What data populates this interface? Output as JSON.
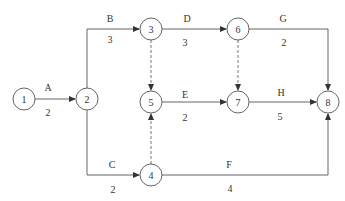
{
  "diagram": {
    "type": "activity-on-arrow network",
    "nodes": [
      {
        "id": "1",
        "label": "1",
        "x": 24,
        "y": 99
      },
      {
        "id": "2",
        "label": "2",
        "x": 87,
        "y": 99
      },
      {
        "id": "3",
        "label": "3",
        "x": 151,
        "y": 29
      },
      {
        "id": "4",
        "label": "4",
        "x": 151,
        "y": 175
      },
      {
        "id": "5",
        "label": "5",
        "x": 151,
        "y": 102
      },
      {
        "id": "6",
        "label": "6",
        "x": 238,
        "y": 29
      },
      {
        "id": "7",
        "label": "7",
        "x": 238,
        "y": 102
      },
      {
        "id": "8",
        "label": "8",
        "x": 328,
        "y": 102
      }
    ],
    "activities": [
      {
        "name": "A",
        "from": "1",
        "to": "2",
        "duration": "2"
      },
      {
        "name": "B",
        "from": "2",
        "to": "3",
        "duration": "3"
      },
      {
        "name": "C",
        "from": "2",
        "to": "4",
        "duration": "2"
      },
      {
        "name": "D",
        "from": "3",
        "to": "6",
        "duration": "3"
      },
      {
        "name": "E",
        "from": "5",
        "to": "7",
        "duration": "2"
      },
      {
        "name": "F",
        "from": "4",
        "to": "8",
        "duration": "4"
      },
      {
        "name": "G",
        "from": "6",
        "to": "8",
        "duration": "2"
      },
      {
        "name": "H",
        "from": "7",
        "to": "8",
        "duration": "5"
      }
    ],
    "dummies": [
      {
        "from": "3",
        "to": "5"
      },
      {
        "from": "4",
        "to": "5"
      },
      {
        "from": "6",
        "to": "7"
      }
    ]
  }
}
